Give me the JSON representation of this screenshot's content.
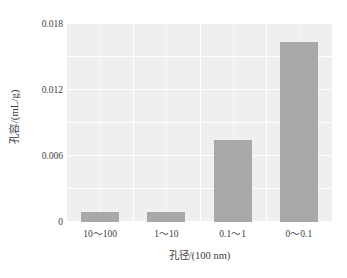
{
  "chart_data": {
    "type": "bar",
    "title": "",
    "categories": [
      "10～100",
      "1～10",
      "0.1～1",
      "0～0.1"
    ],
    "values": [
      0.0009,
      0.0009,
      0.00745,
      0.0164
    ],
    "xlabel": "孔径/(100 nm)",
    "ylabel": "孔容/(mL/g)",
    "ylim": [
      0,
      0.018
    ],
    "yticks": [
      "0.018",
      "0.012",
      "0.006",
      "0"
    ],
    "ytick_values": [
      0.018,
      0.012,
      0.006,
      0
    ],
    "grid": true,
    "grid_color": "#ffffff",
    "legend": "none",
    "bar_color": "#a8a8a8",
    "plot_background": "#efefef",
    "figure_background": "#ffffff"
  }
}
